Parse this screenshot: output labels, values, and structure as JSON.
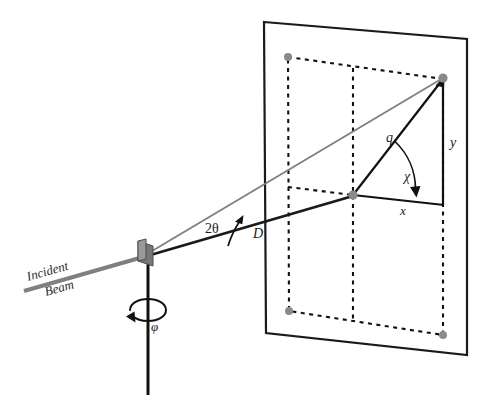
{
  "figure": {
    "background_color": "#ffffff"
  },
  "colors": {
    "ink": "#1a1a1a",
    "beam_gray": "#808080",
    "marker_gray": "#8a8a8a",
    "sample_gray": "#6e6e6e",
    "sample_gray_light": "#9a9a9a",
    "dashed": "#111111"
  },
  "labels": {
    "incident_beam_line1": "Incident",
    "incident_beam_line2": "Beam",
    "phi": "φ",
    "two_theta": "2θ",
    "distance": "D",
    "q_vector": "q",
    "chi": "χ",
    "x_axis": "x",
    "y_axis": "y"
  },
  "elements": {
    "detector_plane": "detector-plane",
    "active_area": "detector-active-area",
    "sample": "sample-plate",
    "rotation_axis": "phi-rotation-axis",
    "rotation_arrow": "phi-rotation-arrow",
    "incident_beam": "incident-beam-ray",
    "direct_beam": "direct-beam-ray",
    "scattered_beam": "scattered-beam-ray",
    "beam_center": "beam-center-marker",
    "scattering_spot": "scattering-spot-marker",
    "two_theta_arc": "two-theta-angle-arc",
    "chi_arc": "chi-angle-arc"
  },
  "geometry": {
    "sample_point": [
      146,
      253
    ],
    "beam_center_point": [
      353,
      195
    ],
    "spot_point": [
      443,
      78
    ],
    "plane_corners": [
      [
        264,
        22
      ],
      [
        467,
        39
      ],
      [
        467,
        355
      ],
      [
        266,
        333
      ]
    ],
    "active_area_corners": [
      [
        288,
        57
      ],
      [
        443,
        79
      ],
      [
        443,
        335
      ],
      [
        289,
        311
      ]
    ],
    "incident_beam_start": [
      24,
      291
    ],
    "axis_bottom": [
      148,
      395
    ],
    "axis_top": [
      148,
      253
    ]
  }
}
